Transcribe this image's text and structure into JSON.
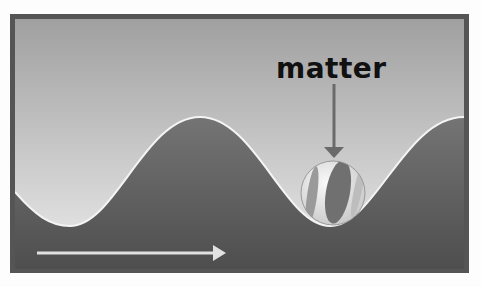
{
  "diagram": {
    "label": "matter",
    "elements": {
      "frame": {
        "border_color": "#555555"
      },
      "sky": {
        "top_color": "#a3a3a3",
        "bottom_color": "#e8e8e8"
      },
      "ground": {
        "top_color": "#6e6e6e",
        "bottom_color": "#505050"
      },
      "wave_line_color": "#f2f2f2",
      "pointer_arrow_color": "#6a6a6a",
      "direction_arrow_color": "#e0e0e0",
      "ball": {
        "description": "beach ball resting in wave trough"
      }
    }
  }
}
